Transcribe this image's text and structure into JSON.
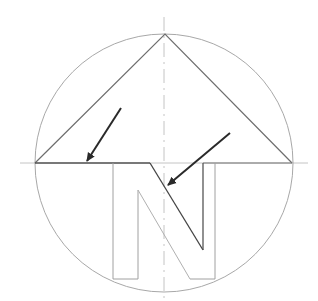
{
  "diagram": {
    "letter": "N",
    "colors": {
      "background": "#ffffff",
      "construction_line": "#b8b8b8",
      "circle": "#a8a8a8",
      "outline": "#7a7a7a",
      "arrow": "#2a2a2a"
    },
    "circle": {
      "cx": 164,
      "cy": 163,
      "r": 129
    },
    "apex": {
      "x": 165,
      "y": 34
    },
    "baseline_y": 163,
    "annotations": [
      {
        "name": "pointer-arrow-left",
        "from": [
          121,
          108
        ],
        "to": [
          87,
          162
        ]
      },
      {
        "name": "pointer-arrow-right",
        "from": [
          230,
          133
        ],
        "to": [
          167,
          186
        ]
      }
    ]
  }
}
